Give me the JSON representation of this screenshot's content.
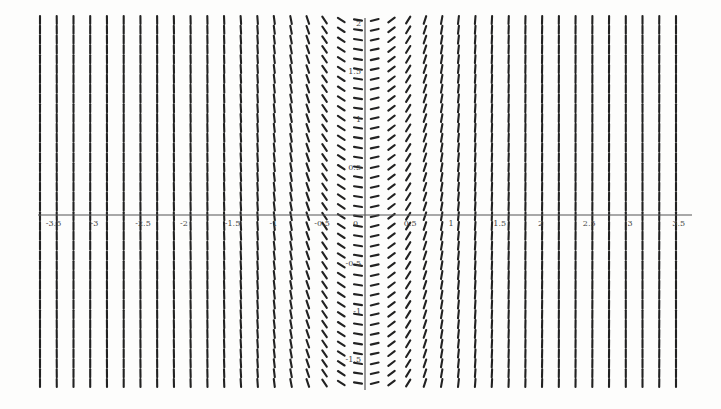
{
  "chart_data": {
    "type": "slope_field",
    "title": "",
    "xlabel": "",
    "ylabel": "",
    "equation_estimate": "dy/dx = f(x) (slopes depend only on x; ~0 at x=0, negative for x<0, positive for x>0, near-vertical at |x|>=1)",
    "xlim": [
      -3.6,
      3.6
    ],
    "ylim": [
      -1.7,
      2.2
    ],
    "grid": false,
    "legend": null,
    "x_ticks": [
      -3.5,
      -3,
      -2.5,
      -2,
      -1.5,
      -1,
      -0.5,
      0,
      0.5,
      1,
      1.5,
      2,
      2.5,
      3,
      3.5
    ],
    "x_tick_labels": [
      "-3.5",
      "-3",
      "-2.5",
      "-2",
      "-1.5",
      "-1",
      "-0.5",
      "0",
      "0.5",
      "1",
      "1.5",
      "2",
      "2.5",
      "3",
      "3.5"
    ],
    "y_ticks": [
      -1.5,
      -1,
      -0.5,
      0.5,
      1,
      1.5,
      2
    ],
    "y_tick_labels": [
      "-1.5",
      "-1",
      "-0.5",
      "0.5",
      "1",
      "1.5",
      "2"
    ],
    "field": {
      "columns": 39,
      "rows": 38,
      "x_start": -3.5,
      "x_step": 0.1842,
      "slope_rule": "slope = 6*x^3 + 2*x (visual approximation)"
    }
  },
  "layout": {
    "origin_px": [
      365,
      215
    ],
    "px_per_unit_x": 89.5,
    "px_per_unit_y": 96,
    "col_px_start": 40,
    "col_px_end": 676,
    "row_px_start": 20,
    "row_px_end": 383,
    "segment_length_px": 8
  }
}
